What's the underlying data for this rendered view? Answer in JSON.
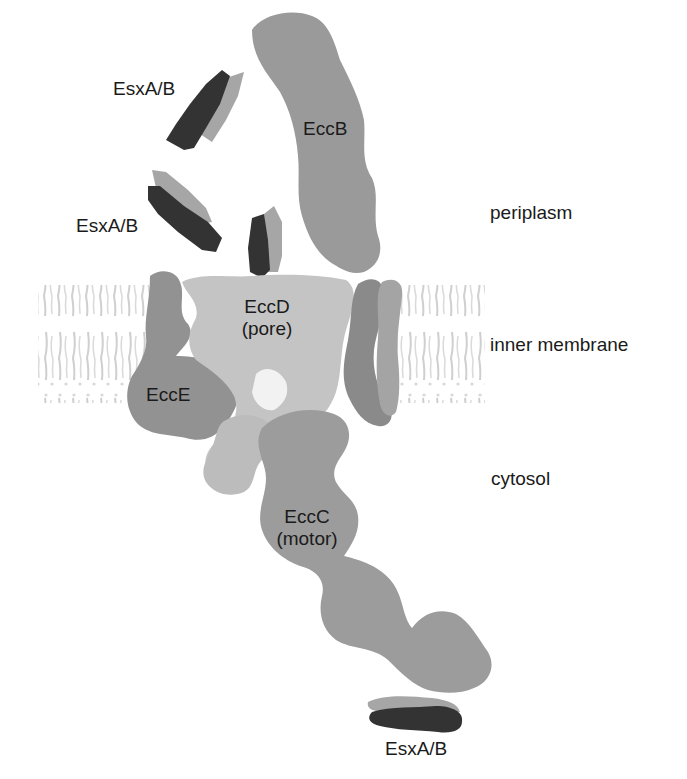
{
  "figure": {
    "colors": {
      "background": "#ffffff",
      "membrane": "#d0d0d0",
      "eccB": "#9a9a9a",
      "eccD": "#c4c4c4",
      "eccE": "#929292",
      "eccC": "#9c9c9c",
      "eccC_dark_region": "#8a8a8a",
      "esx_dark": "#333333",
      "esx_light": "#a6a6a6",
      "text": "#1a1a1a"
    }
  },
  "regions": {
    "periplasm": "periplasm",
    "inner_membrane": "inner membrane",
    "cytosol": "cytosol"
  },
  "components": {
    "esx_top": "EsxA/B",
    "esx_middle": "EsxA/B",
    "esx_bottom": "EsxA/B",
    "eccB": "EccB",
    "eccD_name": "EccD",
    "eccD_role": "(pore)",
    "eccE": "EccE",
    "eccC_name": "EccC",
    "eccC_role": "(motor)"
  }
}
